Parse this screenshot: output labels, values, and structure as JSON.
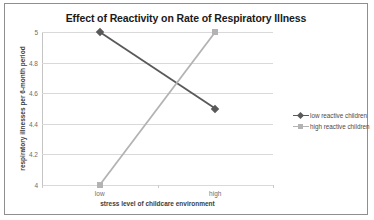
{
  "figure": {
    "border_color": "#8f8f8f",
    "background": "#ffffff"
  },
  "chart_data": {
    "type": "line",
    "title": "Effect of Reactivity on Rate of Respiratory Illness",
    "xlabel": "stress level of childcare environment",
    "ylabel": "respiratory illnesses per 6-month period",
    "categories": [
      "low",
      "high"
    ],
    "ylim": [
      4,
      5
    ],
    "yticks": [
      4,
      4.2,
      4.4,
      4.6,
      4.8,
      5
    ],
    "ytick_labels": [
      "4",
      "4.2",
      "4.4",
      "4.6",
      "4.8",
      "5"
    ],
    "grid": "horizontal",
    "legend_position": "right",
    "series": [
      {
        "name": "low reactive children",
        "values": [
          5,
          4.5
        ],
        "color": "#595959",
        "marker": "diamond"
      },
      {
        "name": "high reactive children",
        "values": [
          4,
          5
        ],
        "color": "#b3b3b3",
        "marker": "square"
      }
    ]
  }
}
